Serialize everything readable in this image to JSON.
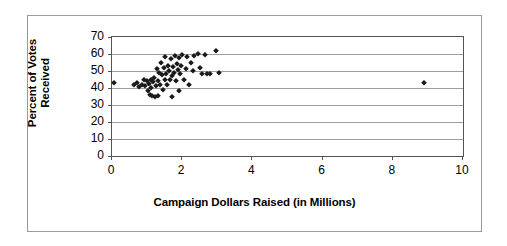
{
  "chart_data": {
    "type": "scatter",
    "title": "",
    "xlabel": "Campaign Dollars Raised (in Millions)",
    "ylabel": "Percent of Votes Received",
    "ylabel_lines": [
      "Percent of Votes",
      "Received"
    ],
    "xlim": [
      0,
      10
    ],
    "ylim": [
      0,
      70
    ],
    "xticks": [
      0,
      2,
      4,
      6,
      8,
      10
    ],
    "yticks": [
      0,
      10,
      20,
      30,
      40,
      50,
      60,
      70
    ],
    "xtick_labels": [
      "0",
      "2",
      "4",
      "6",
      "8",
      "10"
    ],
    "ytick_labels": [
      "0",
      "10",
      "20",
      "30",
      "40",
      "50",
      "60",
      "70"
    ],
    "grid": "horizontal",
    "grid_color": "#9d9d9d",
    "marker": "diamond",
    "marker_color": "#1a1a1a",
    "legend": null,
    "points": [
      [
        0.05,
        43.0
      ],
      [
        0.62,
        41.5
      ],
      [
        0.7,
        43.0
      ],
      [
        0.78,
        40.5
      ],
      [
        0.85,
        42.0
      ],
      [
        0.9,
        44.5
      ],
      [
        0.95,
        41.0
      ],
      [
        1.0,
        44.0
      ],
      [
        1.02,
        38.5
      ],
      [
        1.05,
        42.5
      ],
      [
        1.08,
        36.0
      ],
      [
        1.1,
        44.5
      ],
      [
        1.12,
        40.0
      ],
      [
        1.15,
        35.5
      ],
      [
        1.18,
        43.5
      ],
      [
        1.2,
        46.0
      ],
      [
        1.22,
        35.0
      ],
      [
        1.25,
        41.0
      ],
      [
        1.28,
        51.0
      ],
      [
        1.3,
        44.0
      ],
      [
        1.32,
        35.5
      ],
      [
        1.35,
        49.0
      ],
      [
        1.38,
        42.0
      ],
      [
        1.4,
        55.0
      ],
      [
        1.42,
        47.5
      ],
      [
        1.45,
        39.0
      ],
      [
        1.48,
        52.0
      ],
      [
        1.5,
        45.0
      ],
      [
        1.52,
        58.0
      ],
      [
        1.55,
        48.5
      ],
      [
        1.58,
        41.5
      ],
      [
        1.6,
        53.0
      ],
      [
        1.62,
        50.0
      ],
      [
        1.65,
        44.5
      ],
      [
        1.68,
        57.0
      ],
      [
        1.7,
        47.0
      ],
      [
        1.72,
        35.0
      ],
      [
        1.75,
        52.5
      ],
      [
        1.78,
        49.0
      ],
      [
        1.8,
        59.0
      ],
      [
        1.82,
        44.0
      ],
      [
        1.85,
        54.0
      ],
      [
        1.88,
        50.5
      ],
      [
        1.9,
        38.0
      ],
      [
        1.92,
        57.5
      ],
      [
        1.95,
        48.0
      ],
      [
        1.98,
        53.0
      ],
      [
        2.0,
        59.5
      ],
      [
        2.05,
        45.0
      ],
      [
        2.1,
        51.0
      ],
      [
        2.15,
        58.0
      ],
      [
        2.2,
        41.5
      ],
      [
        2.25,
        55.0
      ],
      [
        2.3,
        50.0
      ],
      [
        2.35,
        59.0
      ],
      [
        2.45,
        60.0
      ],
      [
        2.5,
        52.0
      ],
      [
        2.55,
        48.5
      ],
      [
        2.65,
        59.5
      ],
      [
        2.7,
        48.0
      ],
      [
        2.8,
        48.5
      ],
      [
        2.95,
        62.0
      ],
      [
        3.05,
        49.0
      ],
      [
        8.9,
        43.0
      ]
    ]
  }
}
